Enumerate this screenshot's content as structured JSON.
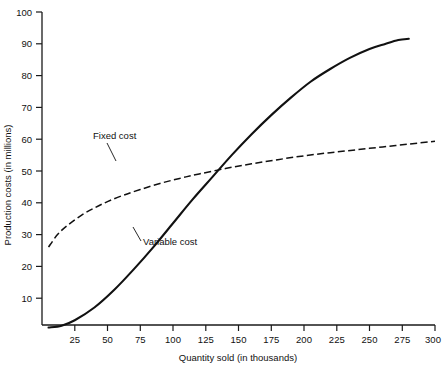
{
  "chart_data": {
    "type": "line",
    "title": "",
    "xlabel": "Quantity sold (in thousands)",
    "ylabel": "Production costs (in millions)",
    "xlim": [
      0,
      300
    ],
    "ylim": [
      0,
      100
    ],
    "grid": false,
    "legend_position": "inline-annotations",
    "xticks": [
      25,
      50,
      75,
      100,
      125,
      150,
      175,
      200,
      225,
      250,
      275,
      300
    ],
    "yticks": [
      10,
      20,
      30,
      40,
      50,
      60,
      70,
      80,
      90,
      100
    ],
    "annotations": [
      {
        "text": "Fixed cost",
        "x": 60,
        "y": 71
      },
      {
        "text": "Variable cost",
        "x": 130,
        "y": 26
      }
    ],
    "series": [
      {
        "name": "Fixed cost",
        "style": "dashed",
        "x": [
          5,
          12,
          20,
          30,
          40,
          50,
          62,
          75,
          90,
          105,
          120,
          140,
          160,
          180,
          200,
          220,
          240,
          260,
          280,
          300
        ],
        "values": [
          34.5,
          38.5,
          41.5,
          44.5,
          46.8,
          48.8,
          50.8,
          52.6,
          54.5,
          56.1,
          57.5,
          59.2,
          60.7,
          62.0,
          63.2,
          64.2,
          65.1,
          66.0,
          66.9,
          67.8
        ]
      },
      {
        "name": "Variable cost",
        "style": "solid",
        "x": [
          5,
          15,
          25,
          40,
          55,
          70,
          85,
          100,
          115,
          130,
          145,
          160,
          175,
          190,
          205,
          220,
          235,
          250,
          262,
          272,
          280
        ],
        "values": [
          9.2,
          9.8,
          11.5,
          15.5,
          21.0,
          27.5,
          34.5,
          42.0,
          49.5,
          56.5,
          63.5,
          70.0,
          76.0,
          81.5,
          86.5,
          90.5,
          94.0,
          96.8,
          98.4,
          99.6,
          100.0
        ]
      }
    ]
  }
}
